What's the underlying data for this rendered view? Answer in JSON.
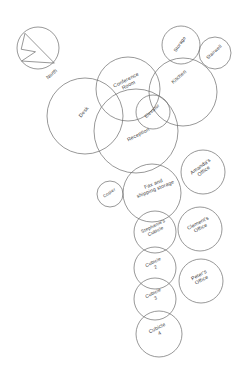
{
  "diagram": {
    "type": "bubble-adjacency-diagram",
    "stroke_color": "#6b6b6b",
    "text_color": "#3a3a3a",
    "background_color": "#ffffff",
    "canvas": {
      "width": 244,
      "height": 373
    }
  },
  "compass": {
    "label": "North",
    "icon": "compass-rose-icon",
    "cx": 38,
    "cy": 48,
    "r": 21
  },
  "spaces": [
    {
      "id": "conference-room",
      "label_lines": [
        "Conference",
        "Room"
      ],
      "label": "Conference Room",
      "cx": 128,
      "cy": 89,
      "r": 32,
      "text_x": 128,
      "text_y": 84,
      "rotate": -27
    },
    {
      "id": "storage",
      "label_lines": [
        "Storage"
      ],
      "label": "Storage",
      "cx": 181,
      "cy": 45,
      "r": 19,
      "text_x": 181,
      "text_y": 45,
      "rotate": -55
    },
    {
      "id": "stairwell",
      "label_lines": [
        "Stairwell"
      ],
      "label": "Stairwell",
      "cx": 215,
      "cy": 53,
      "r": 16,
      "text_x": 215,
      "text_y": 53,
      "rotate": -42
    },
    {
      "id": "kitchen",
      "label_lines": [
        "Kitchen"
      ],
      "label": "Kitchen",
      "cx": 183,
      "cy": 92,
      "r": 34,
      "text_x": 180,
      "text_y": 78,
      "rotate": -42
    },
    {
      "id": "desk",
      "label_lines": [
        "Desk"
      ],
      "label": "Desk",
      "cx": 85,
      "cy": 116,
      "r": 38,
      "text_x": 85,
      "text_y": 113,
      "rotate": -50
    },
    {
      "id": "elevator",
      "label_lines": [
        "Elevator"
      ],
      "label": "Elevator",
      "cx": 153,
      "cy": 112,
      "r": 17,
      "text_x": 153,
      "text_y": 112,
      "rotate": -42
    },
    {
      "id": "reception",
      "label_lines": [
        "Reception"
      ],
      "label": "Reception",
      "cx": 136,
      "cy": 131,
      "r": 42,
      "text_x": 139,
      "text_y": 136,
      "rotate": -27
    },
    {
      "id": "copier",
      "label_lines": [
        "Copier"
      ],
      "label": "Copier",
      "cx": 110,
      "cy": 194,
      "r": 13,
      "text_x": 110,
      "text_y": 194,
      "rotate": -33
    },
    {
      "id": "fax-and-shipping-storage",
      "label_lines": [
        "Fax and",
        "shipping storage"
      ],
      "label": "Fax and shipping storage",
      "cx": 152,
      "cy": 193,
      "r": 29,
      "text_x": 155,
      "text_y": 188,
      "rotate": -22
    },
    {
      "id": "amandas-office",
      "label_lines": [
        "Amanda's",
        "Office"
      ],
      "label": "Amanda's Office",
      "cx": 203,
      "cy": 172,
      "r": 22,
      "text_x": 203,
      "text_y": 170,
      "rotate": -36
    },
    {
      "id": "clements-office",
      "label_lines": [
        "Clement's",
        "Office"
      ],
      "label": "Clement's Office",
      "cx": 200,
      "cy": 229,
      "r": 22,
      "text_x": 200,
      "text_y": 227,
      "rotate": -28
    },
    {
      "id": "stephanies-cubicle",
      "label_lines": [
        "Stephanie's",
        "Cubicle"
      ],
      "label": "Stephanie's Cubicle",
      "cx": 155,
      "cy": 232,
      "r": 21,
      "text_x": 155,
      "text_y": 230,
      "rotate": -26
    },
    {
      "id": "cubicle-2",
      "label_lines": [
        "Cubicle",
        "2"
      ],
      "label": "Cubicle 2",
      "cx": 155,
      "cy": 268,
      "r": 21,
      "text_x": 155,
      "text_y": 266,
      "rotate": -26
    },
    {
      "id": "peters-office",
      "label_lines": [
        "Peter's",
        "Office"
      ],
      "label": "Peter's Office",
      "cx": 201,
      "cy": 281,
      "r": 22,
      "text_x": 201,
      "text_y": 279,
      "rotate": -28
    },
    {
      "id": "cubicle-3",
      "label_lines": [
        "Cubicle",
        "3"
      ],
      "label": "Cubicle 3",
      "cx": 155,
      "cy": 299,
      "r": 21,
      "text_x": 155,
      "text_y": 297,
      "rotate": -26
    },
    {
      "id": "cubicle-4",
      "label_lines": [
        "Cubicle",
        "4"
      ],
      "label": "Cubicle 4",
      "cx": 159,
      "cy": 334,
      "r": 23,
      "text_x": 159,
      "text_y": 332,
      "rotate": -26
    }
  ]
}
